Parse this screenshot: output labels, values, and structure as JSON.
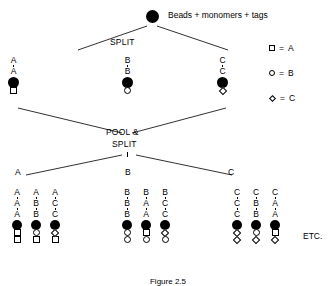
{
  "diagram": {
    "title": "Beads + monomers + tags",
    "operations": {
      "split_label": "SPLIT",
      "pool_label": "POOL &",
      "pool_split_label": "SPLIT"
    },
    "etc_label": "ETC.",
    "legend": [
      {
        "symbol": "square-icon",
        "equals": "=",
        "label": "A"
      },
      {
        "symbol": "circle-icon",
        "equals": "=",
        "label": "B"
      },
      {
        "symbol": "diamond-icon",
        "equals": "=",
        "label": "C"
      }
    ],
    "round1_branch_labels": {
      "left": "A",
      "middle": "B",
      "right": "C"
    },
    "round1_chains": [
      {
        "id": "r1-left",
        "labels": [
          "A",
          "A"
        ],
        "units": [
          "square"
        ]
      },
      {
        "id": "r1-mid",
        "labels": [
          "B",
          "B"
        ],
        "units": [
          "circle"
        ]
      },
      {
        "id": "r1-right",
        "labels": [
          "C",
          "C"
        ],
        "units": [
          "diamond"
        ]
      }
    ],
    "round2_branch_labels": {
      "left": "A",
      "middle": "B",
      "right": "C"
    },
    "round2_groups": [
      {
        "group": "A",
        "header_labels": [
          "A",
          "A",
          "A"
        ],
        "chains": [
          {
            "id": "r2-a1",
            "labels": [
              "A",
              "A",
              "A"
            ],
            "units": [
              "square",
              "square"
            ]
          },
          {
            "id": "r2-a2",
            "labels": [
              "A",
              "B",
              "B"
            ],
            "units": [
              "circle",
              "square"
            ]
          },
          {
            "id": "r2-a3",
            "labels": [
              "A",
              "C",
              "C"
            ],
            "units": [
              "diamond",
              "square"
            ]
          }
        ]
      },
      {
        "group": "B",
        "header_labels": [
          "B",
          "B",
          "B"
        ],
        "chains": [
          {
            "id": "r2-b1",
            "labels": [
              "B",
              "B",
              "B"
            ],
            "units": [
              "circle",
              "circle"
            ]
          },
          {
            "id": "r2-b2",
            "labels": [
              "B",
              "A",
              "A"
            ],
            "units": [
              "square",
              "circle"
            ]
          },
          {
            "id": "r2-b3",
            "labels": [
              "B",
              "C",
              "C"
            ],
            "units": [
              "diamond",
              "circle"
            ]
          }
        ]
      },
      {
        "group": "C",
        "header_labels": [
          "C",
          "C",
          "C"
        ],
        "chains": [
          {
            "id": "r2-c1",
            "labels": [
              "C",
              "C",
              "C"
            ],
            "units": [
              "diamond",
              "diamond"
            ]
          },
          {
            "id": "r2-c2",
            "labels": [
              "C",
              "B",
              "B"
            ],
            "units": [
              "circle",
              "diamond"
            ]
          },
          {
            "id": "r2-c3",
            "labels": [
              "C",
              "A",
              "A"
            ],
            "units": [
              "square",
              "diamond"
            ]
          }
        ]
      }
    ],
    "caption": "Figure 2.5",
    "colors": {
      "bead": "#000000",
      "line": "#1a1a1a",
      "background": "#ffffff"
    }
  }
}
